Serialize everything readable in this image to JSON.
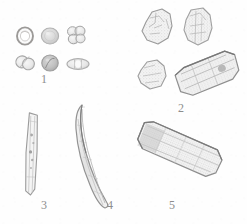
{
  "figure": {
    "kind": "micrograph-plate",
    "background_color": "#fefefe",
    "ink_color": "#8d8d8d",
    "width": 247,
    "height": 224,
    "panels": [
      {
        "number": "1",
        "label": "1",
        "label_x": 44,
        "label_y": 78,
        "description": "six small rounded microfossil grains arranged in two rows of three",
        "specimens": [
          {
            "name": "ring-grain",
            "shape": "annulus",
            "cx": 25,
            "cy": 36,
            "rx": 8,
            "ry": 8.5,
            "rot": 0,
            "fill": "#f4f4f4",
            "stroke": "#9c9a98",
            "texture": "ring"
          },
          {
            "name": "disc-grain",
            "shape": "disc",
            "cx": 50,
            "cy": 36,
            "rx": 8.5,
            "ry": 8,
            "rot": 0,
            "fill": "#d9d9d9",
            "stroke": "#b5b5b5",
            "texture": "smooth"
          },
          {
            "name": "tetrad-grain",
            "shape": "cluster",
            "cx": 76,
            "cy": 35,
            "rx": 9,
            "ry": 9,
            "rot": 0,
            "fill": "#e2e2e2",
            "stroke": "#a9a9a9",
            "texture": "lobed"
          },
          {
            "name": "dyad-grain",
            "shape": "twin-lobe",
            "cx": 25,
            "cy": 63,
            "rx": 8.5,
            "ry": 8,
            "rot": -20,
            "fill": "#e0e0e0",
            "stroke": "#a6a6a6",
            "texture": "split"
          },
          {
            "name": "dark-disc-grain",
            "shape": "disc",
            "cx": 50,
            "cy": 63,
            "rx": 8,
            "ry": 8,
            "rot": 0,
            "fill": "#c7c7c7",
            "stroke": "#9e9e9e",
            "texture": "dark"
          },
          {
            "name": "elliptical-grain",
            "shape": "ellipse",
            "cx": 78,
            "cy": 64,
            "rx": 11,
            "ry": 5.5,
            "rot": 0,
            "fill": "#e8e8e8",
            "stroke": "#aeaeae",
            "texture": "banded"
          }
        ]
      },
      {
        "number": "2",
        "label": "2",
        "label_x": 178,
        "label_y": 107,
        "description": "four angular mineral grains with rough granular surfaces",
        "specimens": [
          {
            "name": "angular-grain-upper-left",
            "cx": 157,
            "cy": 31,
            "w": 30,
            "h": 34,
            "rot": 0,
            "fill": "#efefef",
            "stroke": "#9a9a9a"
          },
          {
            "name": "angular-grain-upper-right",
            "cx": 196,
            "cy": 28,
            "w": 27,
            "h": 36,
            "rot": 0,
            "fill": "#f1f1f1",
            "stroke": "#a0a0a0"
          },
          {
            "name": "angular-grain-lower-left",
            "cx": 152,
            "cy": 78,
            "w": 27,
            "h": 28,
            "rot": 0,
            "fill": "#f0f0f0",
            "stroke": "#9d9d9d"
          },
          {
            "name": "elongate-grain-lower-right",
            "cx": 206,
            "cy": 73,
            "w": 62,
            "h": 34,
            "rot": -22,
            "fill": "#ededed",
            "stroke": "#8f8f8f"
          }
        ]
      },
      {
        "number": "3",
        "label": "3",
        "label_x": 41,
        "label_y": 205,
        "description": "slender straight vertical rod-shaped particle with internal speckles",
        "specimens": [
          {
            "name": "vertical-rod",
            "cx": 31,
            "cy": 155,
            "w": 11,
            "h": 80,
            "rot": 2,
            "fill": "#f2f2f2",
            "stroke": "#9b9b9b"
          }
        ]
      },
      {
        "number": "4",
        "label": "4",
        "label_x": 107,
        "label_y": 205,
        "description": "curved spindle-shaped elongate particle, lens profile",
        "specimens": [
          {
            "name": "curved-spindle",
            "cx": 93,
            "cy": 140,
            "w": 26,
            "h": 78,
            "rot": 12,
            "fill": "#ededed",
            "stroke": "#929292"
          }
        ]
      },
      {
        "number": "5",
        "label": "5",
        "label_x": 169,
        "label_y": 205,
        "description": "diagonal elongate rod with dense stippled granular texture",
        "specimens": [
          {
            "name": "diagonal-stippled-rod",
            "cx": 165,
            "cy": 152,
            "w": 86,
            "h": 28,
            "rot": 22,
            "fill": "#f0f0f0",
            "stroke": "#8e8e8e"
          }
        ]
      }
    ]
  }
}
